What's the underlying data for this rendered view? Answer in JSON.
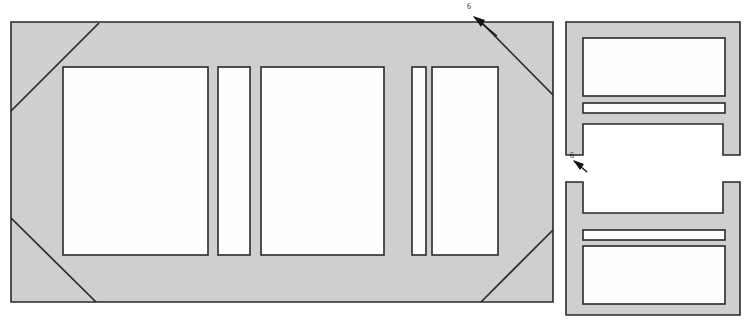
{
  "figure": {
    "background_color": "#ffffff",
    "body_fill_color": "#cfcfcf",
    "aperture_fill_color": "#fefefe",
    "line_color": "#2a2a2a",
    "views": [
      {
        "id": "main-front-view",
        "name": "front-elevation-view",
        "description": "Large rectangular frame with chamfered corners and three apertures",
        "outline": "11,22 553,22 553,302 11,302",
        "chamfer_corners": [
          "top-left",
          "top-right",
          "bottom-left",
          "bottom-right"
        ],
        "apertures": [
          {
            "id": "aperture-left",
            "name": "large-left-aperture",
            "x": 63,
            "y": 67,
            "w": 145,
            "h": 188
          },
          {
            "id": "aperture-slot-1",
            "name": "narrow-slot-left",
            "x": 218,
            "y": 67,
            "w": 32,
            "h": 188
          },
          {
            "id": "aperture-mid",
            "name": "large-center-aperture",
            "x": 261,
            "y": 67,
            "w": 123,
            "h": 188
          },
          {
            "id": "aperture-slot-2",
            "name": "narrow-slot-right",
            "x": 412,
            "y": 67,
            "w": 14,
            "h": 188
          },
          {
            "id": "aperture-right",
            "name": "large-right-aperture",
            "x": 432,
            "y": 67,
            "w": 66,
            "h": 188
          }
        ]
      },
      {
        "id": "top-right-view",
        "name": "upper-side-elevation-view",
        "description": "Rectangular body with upper window, horizontal slot and two bottom corner notches",
        "outline": "566,22 740,22 740,155 566,155",
        "apertures": [
          {
            "id": "tr-window",
            "name": "upper-window-aperture",
            "x": 583,
            "y": 38,
            "w": 142,
            "h": 58
          },
          {
            "id": "tr-slot",
            "name": "horizontal-slot",
            "x": 583,
            "y": 103,
            "w": 142,
            "h": 10
          }
        ],
        "notches": [
          {
            "id": "tr-notch-left",
            "name": "bottom-left-notch",
            "x": 566,
            "y": 124,
            "w": 17,
            "h": 31
          },
          {
            "id": "tr-notch-right",
            "name": "bottom-right-notch",
            "x": 723,
            "y": 124,
            "w": 17,
            "h": 31
          }
        ]
      },
      {
        "id": "bottom-right-view",
        "name": "lower-side-elevation-view",
        "description": "Mirrored rectangular body with two top corner notches, horizontal slot and lower window",
        "outline": "566,182 740,182 740,315 566,315",
        "apertures": [
          {
            "id": "br-slot",
            "name": "horizontal-slot",
            "x": 583,
            "y": 230,
            "w": 142,
            "h": 10
          },
          {
            "id": "br-window",
            "name": "lower-window-aperture",
            "x": 583,
            "y": 246,
            "w": 142,
            "h": 58
          }
        ],
        "notches": [
          {
            "id": "br-notch-left",
            "name": "top-left-notch",
            "x": 566,
            "y": 182,
            "w": 17,
            "h": 31
          },
          {
            "id": "br-notch-right",
            "name": "top-right-notch",
            "x": 723,
            "y": 182,
            "w": 17,
            "h": 31
          }
        ]
      }
    ],
    "reference_callouts": [
      {
        "id": "callout-top",
        "name": "reference-callout-upper",
        "label": "6",
        "label_x": 469,
        "label_y": 9,
        "arrow_from_x": 497,
        "arrow_from_y": 36,
        "arrow_to_x": 473,
        "arrow_to_y": 16
      },
      {
        "id": "callout-mid",
        "name": "reference-callout-lower",
        "label": "6",
        "label_x": 572,
        "label_y": 168,
        "arrow_from_x": 586,
        "arrow_from_y": 172,
        "arrow_to_x": 573,
        "arrow_to_y": 160
      }
    ]
  }
}
